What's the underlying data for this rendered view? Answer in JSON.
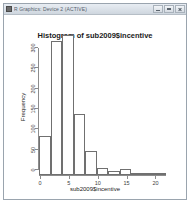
{
  "window": {
    "title": "R Graphics: Device 2 (ACTIVE)",
    "icon": "r-app-icon",
    "minimize_label": "Minimize",
    "maximize_label": "Maximize",
    "close_label": "Close"
  },
  "chart_data": {
    "type": "bar",
    "title": "Histogram of sub2009$incentive",
    "xlabel": "sub2009$incentive",
    "ylabel": "Frequency",
    "xlim": [
      0,
      22
    ],
    "ylim": [
      0,
      300
    ],
    "xticks": [
      0,
      5,
      10,
      15,
      20
    ],
    "yticks": [
      0,
      50,
      100,
      150,
      200,
      250,
      300
    ],
    "grid": false,
    "legend": null,
    "bin_width": 2,
    "bin_edges": [
      0,
      2,
      4,
      6,
      8,
      10,
      12,
      14,
      16,
      18,
      20,
      22
    ],
    "categories": [
      "0-2",
      "2-4",
      "4-6",
      "6-8",
      "8-10",
      "10-12",
      "12-14",
      "14-16",
      "16-18",
      "18-20",
      "20-22"
    ],
    "values": [
      95,
      330,
      355,
      150,
      60,
      17,
      10,
      16,
      4,
      2,
      1
    ],
    "note_clipped": "Tallest bars exceed the plotted y-axis range of 300"
  }
}
